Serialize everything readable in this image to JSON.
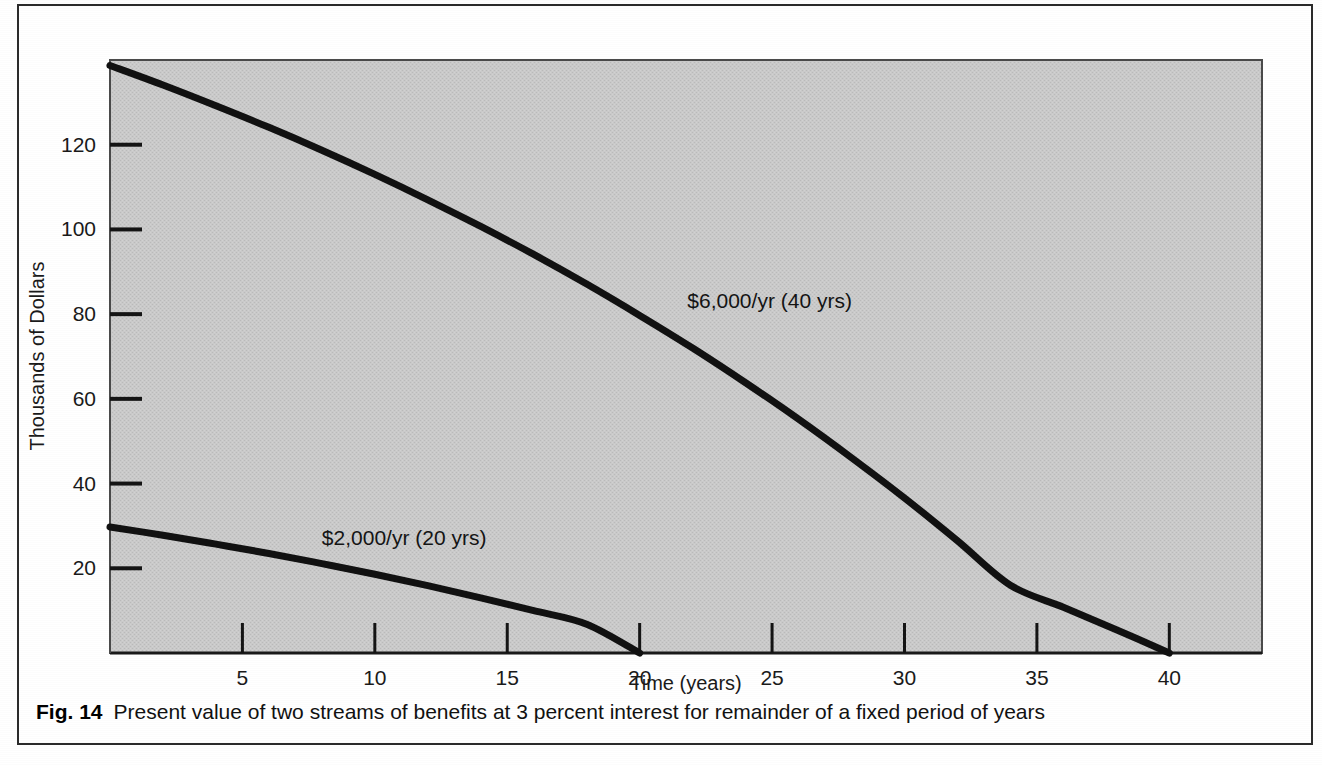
{
  "figure": {
    "caption_tag": "Fig. 14",
    "caption_text": "Present value of two streams of benefits at 3 percent interest for remainder of a fixed period of years"
  },
  "chart_data": {
    "type": "line",
    "title": "",
    "xlabel": "Time (years)",
    "ylabel": "Thousands of Dollars",
    "xlim": [
      0,
      43.5
    ],
    "ylim": [
      0,
      140
    ],
    "xticks": [
      5,
      10,
      15,
      20,
      25,
      30,
      35,
      40
    ],
    "xtick_labels": [
      "5",
      "10",
      "15",
      "20",
      "25",
      "30",
      "35",
      "40"
    ],
    "yticks": [
      20,
      40,
      60,
      80,
      100,
      120
    ],
    "ytick_labels": [
      "20",
      "40",
      "60",
      "80",
      "100",
      "120"
    ],
    "grid": false,
    "legend": "inline-annotations",
    "plot_background": "#c8c8c8",
    "line_color": "#111111",
    "series": [
      {
        "name": "$6,000/yr (40 yrs)",
        "annotation": "$6,000/yr (40 yrs)",
        "x": [
          0,
          2,
          4,
          6,
          8,
          10,
          12,
          14,
          16,
          18,
          20,
          22,
          24,
          26,
          28,
          30,
          32,
          34,
          36,
          38,
          40
        ],
        "values": [
          138.7,
          134.1,
          129.2,
          124.1,
          118.7,
          113.0,
          107.0,
          100.7,
          94.1,
          87.1,
          79.7,
          72.0,
          63.8,
          55.2,
          46.1,
          36.6,
          26.5,
          16.0,
          10.8,
          5.5,
          0.0
        ]
      },
      {
        "name": "$2,000/yr (20 yrs)",
        "annotation": "$2,000/yr (20 yrs)",
        "x": [
          0,
          2,
          4,
          6,
          8,
          10,
          12,
          14,
          16,
          18,
          20
        ],
        "values": [
          29.75,
          27.8,
          25.7,
          23.5,
          21.1,
          18.6,
          15.9,
          13.0,
          10.0,
          6.8,
          0.0
        ]
      }
    ],
    "annotations": [
      {
        "text": "$6,000/yr (40 yrs)",
        "x": 21.8,
        "y": 81.5
      },
      {
        "text": "$2,000/yr (20 yrs)",
        "x": 8.0,
        "y": 25.4
      }
    ]
  }
}
